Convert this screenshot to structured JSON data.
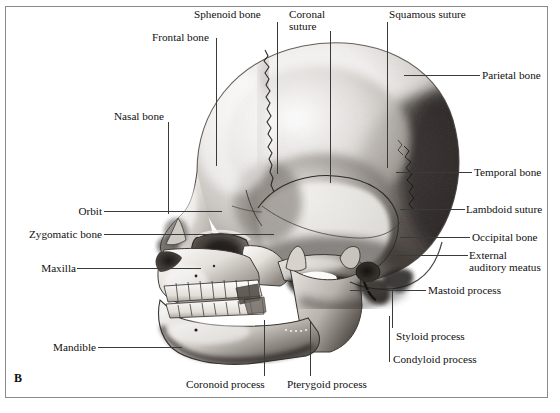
{
  "figure": {
    "panel_letter": "B",
    "background_color": "#ffffff",
    "frame_color": "#8a8a8a",
    "leader_color": "#3a3a3a",
    "text_color": "#101010"
  },
  "labels": {
    "sphenoid_bone": "Sphenoid bone",
    "coronal_suture_l1": "Coronal",
    "coronal_suture_l2": "suture",
    "squamous_suture": "Squamous suture",
    "frontal_bone": "Frontal bone",
    "parietal_bone": "Parietal bone",
    "nasal_bone": "Nasal bone",
    "temporal_bone": "Temporal bone",
    "orbit": "Orbit",
    "lambdoid_suture": "Lambdoid suture",
    "zygomatic_bone": "Zygomatic bone",
    "occipital_bone": "Occipital bone",
    "external_auditory_meatus_l1": "External",
    "external_auditory_meatus_l2": "auditory meatus",
    "maxilla": "Maxilla",
    "mastoid_process": "Mastoid process",
    "mandible": "Mandible",
    "styloid_process": "Styloid process",
    "condyloid_process": "Condyloid process",
    "coronoid_process": "Coronoid process",
    "pterygoid_process": "Pterygoid process"
  }
}
